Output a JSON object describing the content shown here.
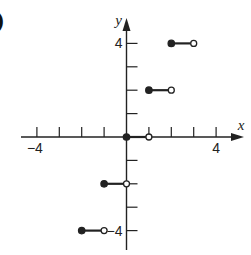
{
  "figure": {
    "corner_label": ")"
  },
  "chart_data": {
    "type": "line",
    "title": "",
    "xlabel": "x",
    "ylabel": "y",
    "xlim": [
      -4.5,
      5
    ],
    "ylim": [
      -5,
      4.8
    ],
    "x_ticks": [
      -4,
      -3,
      -2,
      -1,
      0,
      1,
      2,
      3,
      4
    ],
    "x_tick_labels": [
      {
        "value": -4,
        "label": "-4"
      },
      {
        "value": 4,
        "label": "4"
      }
    ],
    "y_ticks": [
      -4,
      -3,
      -2,
      -1,
      0,
      1,
      2,
      3,
      4
    ],
    "y_tick_labels": [
      {
        "value": 4,
        "label": "4"
      },
      {
        "value": -4,
        "label": "-4"
      }
    ],
    "grid": false,
    "legend": null,
    "segments": [
      {
        "x_start": -2,
        "x_end": -1,
        "y": -4,
        "start": "closed",
        "end": "open"
      },
      {
        "x_start": -1,
        "x_end": 0,
        "y": -2,
        "start": "closed",
        "end": "open"
      },
      {
        "x_start": 0,
        "x_end": 1,
        "y": 0,
        "start": "closed",
        "end": "open"
      },
      {
        "x_start": 1,
        "x_end": 2,
        "y": 2,
        "start": "closed",
        "end": "open"
      },
      {
        "x_start": 2,
        "x_end": 3,
        "y": 4,
        "start": "closed",
        "end": "open"
      }
    ]
  }
}
